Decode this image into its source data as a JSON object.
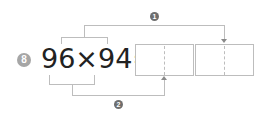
{
  "problem": {
    "number": "8",
    "expression": "96×94=",
    "step_badges": [
      "1",
      "2"
    ]
  },
  "answer_boxes": [
    {
      "value": ""
    },
    {
      "value": ""
    }
  ]
}
